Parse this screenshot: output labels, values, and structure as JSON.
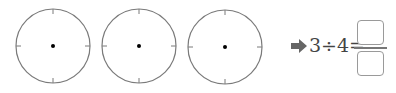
{
  "circles": [
    {
      "cx": 53,
      "cy": 46,
      "r": 37
    },
    {
      "cx": 139,
      "cy": 46,
      "r": 37
    },
    {
      "cx": 225,
      "cy": 46,
      "r": 37
    }
  ],
  "colors": {
    "circle_stroke": "#7a7a7a",
    "center_dot": "#000000",
    "arrow": "#666666",
    "text": "#444444",
    "box_border": "#9a9a9a"
  },
  "equation": {
    "dividend": "3",
    "operator": "÷",
    "divisor": "4",
    "equals": "=",
    "expression": "3÷4=",
    "numerator_value": "",
    "denominator_value": ""
  },
  "icons": {
    "arrow": "right-arrow-icon"
  }
}
